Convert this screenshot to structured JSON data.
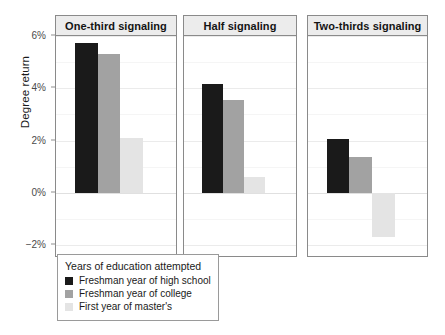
{
  "chart_data": {
    "type": "bar",
    "title": "",
    "xlabel": "",
    "ylabel": "Degree return",
    "ylim": [
      -2,
      6
    ],
    "yticks": [
      6,
      4,
      2,
      0,
      -2
    ],
    "ytick_labels": [
      "6%",
      "4%",
      "2%",
      "0%",
      "−2%"
    ],
    "grid": true,
    "facet_variable": "signaling share",
    "panels": [
      {
        "label": "One-third signaling",
        "values": [
          5.75,
          5.3,
          2.1
        ]
      },
      {
        "label": "Half signaling",
        "values": [
          4.15,
          3.55,
          0.6
        ]
      },
      {
        "label": "Two-thirds signaling",
        "values": [
          2.05,
          1.35,
          -1.7
        ]
      }
    ],
    "categories": [
      "One-third signaling",
      "Half signaling",
      "Two-thirds signaling"
    ],
    "series": [
      {
        "name": "Freshman year of high school",
        "color": "#1a1a1a",
        "values": [
          5.75,
          4.15,
          2.05
        ]
      },
      {
        "name": "Freshman year of college",
        "color": "#a2a2a2",
        "values": [
          5.3,
          3.55,
          1.35
        ]
      },
      {
        "name": "First year of master's",
        "color": "#e4e4e4",
        "values": [
          2.1,
          0.6,
          -1.7
        ]
      }
    ],
    "legend": {
      "title": "Years of education attempted",
      "position": "bottom-left",
      "entries": [
        {
          "label": "Freshman year of high school",
          "color": "#1a1a1a"
        },
        {
          "label": "Freshman year of college",
          "color": "#a2a2a2"
        },
        {
          "label": "First year of master's",
          "color": "#e4e4e4"
        }
      ]
    },
    "colors": {
      "panel_strip": "#ececec",
      "panel_border": "#8a8a8a",
      "gridline": "#ebebeb",
      "text": "#1a1a1a"
    }
  }
}
